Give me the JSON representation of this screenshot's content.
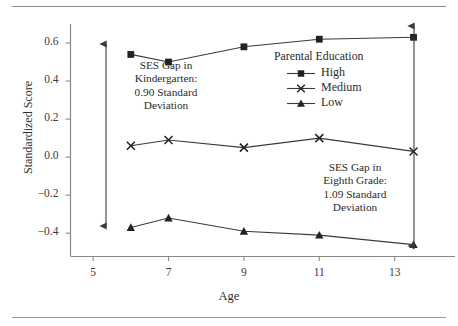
{
  "chart_data": {
    "type": "line",
    "title": "",
    "xlabel": "Age",
    "ylabel": "Standardized Score",
    "xlim": [
      4.4,
      14.6
    ],
    "ylim": [
      -0.52,
      0.7
    ],
    "xticks": [
      "5",
      "7",
      "9",
      "11",
      "13"
    ],
    "xtick_values": [
      5,
      7,
      9,
      11,
      13
    ],
    "yticks": [
      "0.6",
      "0.4",
      "0.2",
      "0.0",
      "−0.2",
      "−0.4"
    ],
    "ytick_values": [
      0.6,
      0.4,
      0.2,
      0.0,
      -0.2,
      -0.4
    ],
    "grid": false,
    "legend_position": "upper-right-inside",
    "legend_title": "Parental Education",
    "x": [
      6,
      7,
      9,
      11,
      13.5
    ],
    "series": [
      {
        "name": "High",
        "marker": "square",
        "values": [
          0.54,
          0.5,
          0.58,
          0.62,
          0.63
        ]
      },
      {
        "name": "Medium",
        "marker": "x",
        "values": [
          0.06,
          0.09,
          0.05,
          0.1,
          0.03
        ]
      },
      {
        "name": "Low",
        "marker": "triangle",
        "values": [
          -0.37,
          -0.32,
          -0.39,
          -0.41,
          -0.46
        ]
      }
    ],
    "annotations": [
      {
        "id": "kindergarten-gap",
        "lines": [
          "SES Gap in",
          "Kindergarten:",
          "0.90 Standard",
          "Deviation"
        ],
        "value": 0.9,
        "at_x": 6
      },
      {
        "id": "eighth-grade-gap",
        "lines": [
          "SES Gap in",
          "Eighth Grade:",
          "1.09 Standard",
          "Deviation"
        ],
        "value": 1.09,
        "at_x": 13.5
      }
    ],
    "colors": {
      "line": "#3a3a3a",
      "marker": "#222222",
      "axis": "#8a8a8a",
      "text": "#2b2b2b"
    }
  },
  "legend": {
    "title": "Parental Education",
    "items": [
      {
        "label": "High",
        "marker": "square"
      },
      {
        "label": "Medium",
        "marker": "x"
      },
      {
        "label": "Low",
        "marker": "triangle"
      }
    ]
  },
  "axes": {
    "y_title": "Standardized Score",
    "x_title": "Age",
    "ytick_labels": [
      "0.6",
      "0.4",
      "0.2",
      "0.0",
      "−0.2",
      "−0.4"
    ],
    "xtick_labels": [
      "5",
      "7",
      "9",
      "11",
      "13"
    ]
  },
  "annotations": {
    "kindergarten": {
      "line1": "SES Gap in",
      "line2": "Kindergarten:",
      "line3": "0.90 Standard",
      "line4": "Deviation"
    },
    "eighth_grade": {
      "line1": "SES Gap in",
      "line2": "Eighth Grade:",
      "line3": "1.09 Standard",
      "line4": "Deviation"
    }
  }
}
